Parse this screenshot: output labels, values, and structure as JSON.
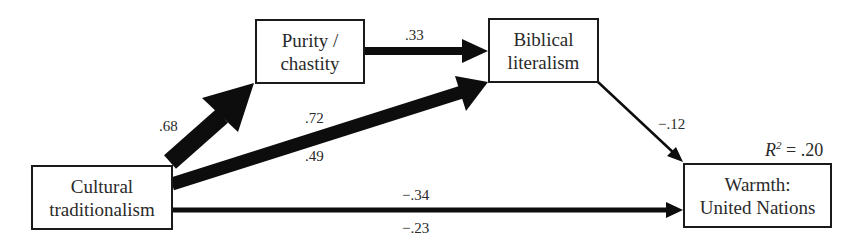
{
  "diagram": {
    "type": "path-model",
    "nodes": [
      {
        "id": "cultural",
        "line1": "Cultural",
        "line2": "traditionalism"
      },
      {
        "id": "purity",
        "line1": "Purity /",
        "line2": "chastity"
      },
      {
        "id": "biblical",
        "line1": "Biblical",
        "line2": "literalism"
      },
      {
        "id": "warmth",
        "line1": "Warmth:",
        "line2": "United Nations"
      }
    ],
    "edges": [
      {
        "from": "cultural",
        "to": "purity",
        "coef": ".68"
      },
      {
        "from": "purity",
        "to": "biblical",
        "coef": ".33"
      },
      {
        "from": "cultural",
        "to": "biblical",
        "coef_top": ".72",
        "coef_bottom": ".49"
      },
      {
        "from": "biblical",
        "to": "warmth",
        "coef": "−.12"
      },
      {
        "from": "cultural",
        "to": "warmth",
        "coef_top": "−.34",
        "coef_bottom": "−.23"
      }
    ],
    "r_squared": {
      "label": "R",
      "sup": "2",
      "value": "= .20"
    }
  }
}
